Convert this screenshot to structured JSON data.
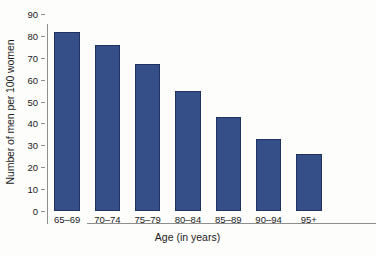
{
  "chart_data": {
    "type": "bar",
    "title": "",
    "subtitle": "",
    "xlabel": "Age (in years)",
    "ylabel": "Number of men per 100 women",
    "categories": [
      "65–69",
      "70–74",
      "75–79",
      "80–84",
      "85–89",
      "90–94",
      "95+"
    ],
    "values": [
      82,
      76,
      67,
      55,
      43,
      33,
      26
    ],
    "series": [
      {
        "name": "Number of men per 100 women",
        "values": [
          82,
          76,
          67,
          55,
          43,
          33,
          26
        ]
      }
    ],
    "ylim": [
      0,
      90
    ],
    "ytick_values": [
      0,
      10,
      20,
      30,
      40,
      50,
      60,
      70,
      80,
      90
    ],
    "ytick_labels": [
      "0",
      "10",
      "20",
      "30",
      "40",
      "50",
      "60",
      "70",
      "80",
      "90"
    ],
    "grid": false,
    "legend": false,
    "legend_position": "none",
    "bar_color": "#355089",
    "bar_edge_color": "#1f3260",
    "axis_color": "#8e8e8e",
    "background_color": "#fdfdfb",
    "annotations": []
  }
}
